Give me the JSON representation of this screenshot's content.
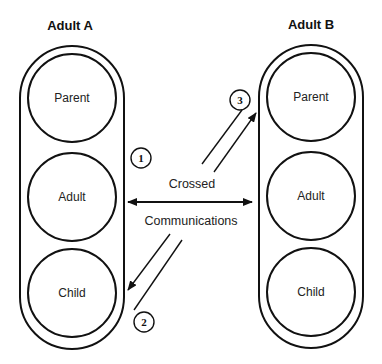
{
  "diagram": {
    "type": "transactional-analysis",
    "persons": [
      {
        "name": "Adult A",
        "states": [
          "Parent",
          "Adult",
          "Child"
        ]
      },
      {
        "name": "Adult B",
        "states": [
          "Parent",
          "Adult",
          "Child"
        ]
      }
    ],
    "labels": {
      "crossed": "Crossed",
      "communications": "Communications"
    },
    "markers": [
      {
        "id": "1",
        "label": "1"
      },
      {
        "id": "2",
        "label": "2"
      },
      {
        "id": "3",
        "label": "3"
      }
    ],
    "edges": [
      {
        "from": "Adult A.Adult",
        "to": "Adult B.Adult",
        "style": "double-arrow",
        "label": "Crossed Communications"
      },
      {
        "from": "Adult B",
        "to": "Adult A.Child",
        "marker": "2",
        "style": "arrow"
      },
      {
        "from": "Adult A",
        "to": "Adult B.Parent",
        "marker": "3",
        "style": "arrow"
      }
    ],
    "colors": {
      "stroke": "#111111",
      "background": "#ffffff"
    }
  }
}
